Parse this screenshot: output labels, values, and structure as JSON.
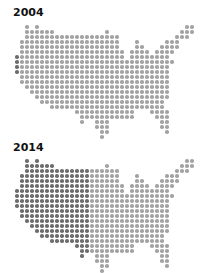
{
  "chart_data": [
    {
      "type": "heatmap",
      "title": "2004",
      "description": "Dot-grid map of the contiguous United States; almost uniform light gray with darker dots along the Pacific coast",
      "grid": {
        "pitch_px": 5,
        "origin_x": 17
      },
      "dark_max_col": 0,
      "colors": {
        "dark": "#6d6d6d",
        "light": "#a3a3a3"
      }
    },
    {
      "type": "heatmap",
      "title": "2014",
      "description": "Dot-grid map of the contiguous United States; western half (about 15 columns) dark gray, eastern half light gray",
      "grid": {
        "pitch_px": 5,
        "origin_x": 17
      },
      "dark_max_col": 14,
      "colors": {
        "dark": "#6d6d6d",
        "light": "#a3a3a3"
      }
    }
  ],
  "map_rows": [
    [
      [
        2,
        2
      ],
      [
        4,
        4
      ],
      [
        34,
        35
      ]
    ],
    [
      [
        2,
        7
      ],
      [
        18,
        18
      ],
      [
        33,
        35
      ]
    ],
    [
      [
        2,
        20
      ],
      [
        32,
        34
      ]
    ],
    [
      [
        1,
        20
      ],
      [
        24,
        24
      ],
      [
        30,
        32
      ]
    ],
    [
      [
        1,
        20
      ],
      [
        24,
        25
      ],
      [
        29,
        32
      ]
    ],
    [
      [
        1,
        21
      ],
      [
        23,
        26
      ],
      [
        28,
        31
      ]
    ],
    [
      [
        0,
        21
      ],
      [
        23,
        30
      ]
    ],
    [
      [
        0,
        31
      ]
    ],
    [
      [
        0,
        30
      ]
    ],
    [
      [
        0,
        30
      ]
    ],
    [
      [
        1,
        30
      ]
    ],
    [
      [
        1,
        30
      ]
    ],
    [
      [
        2,
        30
      ]
    ],
    [
      [
        3,
        30
      ]
    ],
    [
      [
        4,
        30
      ]
    ],
    [
      [
        5,
        29
      ]
    ],
    [
      [
        7,
        29
      ]
    ],
    [
      [
        12,
        23
      ],
      [
        27,
        30
      ]
    ],
    [
      [
        13,
        23
      ],
      [
        28,
        30
      ]
    ],
    [
      [
        13,
        13
      ],
      [
        16,
        18
      ],
      [
        29,
        30
      ]
    ],
    [
      [
        16,
        18
      ],
      [
        29,
        30
      ]
    ],
    [
      [
        17,
        18
      ],
      [
        30,
        30
      ]
    ],
    [
      [
        17,
        17
      ]
    ]
  ],
  "panels": [
    {
      "label": "2004",
      "label_top": 7,
      "map_top": 27
    },
    {
      "label": "2014",
      "label_top": 142,
      "map_top": 161
    }
  ]
}
